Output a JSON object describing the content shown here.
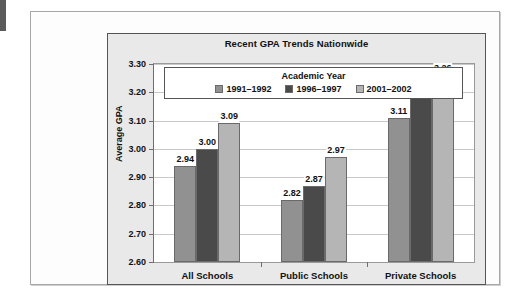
{
  "chart_data": {
    "type": "bar",
    "title": "Recent GPA Trends Nationwide",
    "xlabel": "",
    "ylabel": "Average GPA",
    "categories": [
      "All Schools",
      "Public Schools",
      "Private Schools"
    ],
    "legend_title": "Academic Year",
    "legend_position": "inside-top-center",
    "grid": true,
    "ylim": [
      2.6,
      3.3
    ],
    "ytick_step": 0.1,
    "ytick_labels": [
      "3.30",
      "3.20",
      "3.10",
      "3.00",
      "2.90",
      "2.80",
      "2.70",
      "2.60"
    ],
    "ytick_values": [
      3.3,
      3.2,
      3.1,
      3.0,
      2.9,
      2.8,
      2.7,
      2.6
    ],
    "series": [
      {
        "name": "1991–1992",
        "color": "#919191",
        "values": [
          2.94,
          2.82,
          3.11
        ],
        "labels": [
          "2.94",
          "2.82",
          "3.11"
        ]
      },
      {
        "name": "1996–1997",
        "color": "#4a4a4a",
        "values": [
          3.0,
          2.87,
          3.19
        ],
        "labels": [
          "3.00",
          "2.87",
          "3.19"
        ]
      },
      {
        "name": "2001–2002",
        "color": "#b5b5b5",
        "values": [
          3.09,
          2.97,
          3.26
        ],
        "labels": [
          "3.09",
          "2.97",
          "3.26"
        ]
      }
    ]
  }
}
